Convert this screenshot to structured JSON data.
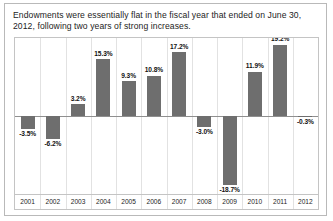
{
  "figure": {
    "title": "Endowments were essentially flat in the fiscal year that ended on June 30, 2012, following two years of strong increases.",
    "bar_color": "#6e6e6e",
    "frame_color": "#c4c4c4",
    "grid_color": "#e2e2e2",
    "baseline_color": "#8f8f8f",
    "text_color": "#1c1c1c"
  },
  "chart_data": {
    "type": "bar",
    "title": "Endowments were essentially flat in the fiscal year that ended on June 30, 2012, following two years of strong increases.",
    "xlabel": "",
    "ylabel": "",
    "categories": [
      "2001",
      "2002",
      "2003",
      "2004",
      "2005",
      "2006",
      "2007",
      "2008",
      "2009",
      "2010",
      "2011",
      "2012"
    ],
    "values": [
      -3.5,
      -6.2,
      3.2,
      15.3,
      9.3,
      10.8,
      17.2,
      -3.0,
      -18.7,
      11.9,
      19.2,
      -0.3
    ],
    "data_labels": [
      "-3.5%",
      "-6.2%",
      "3.2%",
      "15.3%",
      "9.3%",
      "10.8%",
      "17.2%",
      "-3.0%",
      "-18.7%",
      "11.9%",
      "19.2%",
      "-0.3%"
    ],
    "ylim": [
      -21.0,
      21.0
    ],
    "grid": "vertical-category-separators",
    "legend": "none"
  }
}
